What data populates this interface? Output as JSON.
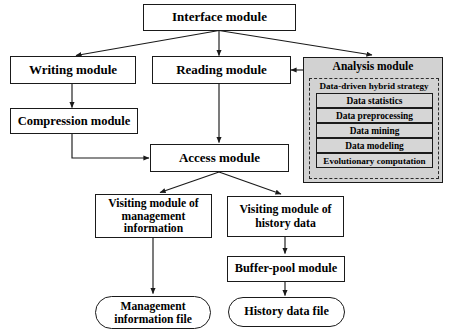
{
  "diagram": {
    "colors": {
      "box_border": "#1a1a1a",
      "box_fill": "#ffffff",
      "group_fill": "#d2d2d2",
      "sub_item_fill": "#d6d6d6",
      "edge": "#1a1a1a"
    },
    "nodes": {
      "interface_module": "Interface module",
      "writing_module": "Writing module",
      "reading_module": "Reading module",
      "analysis_module": "Analysis module",
      "compression_module": "Compression module",
      "access_module": "Access module",
      "visiting_management": "Visiting module of management information",
      "visiting_history": "Visiting module of history data",
      "buffer_pool_module": "Buffer-pool module",
      "management_file": "Management information file",
      "history_file": "History data file"
    },
    "analysis_group": {
      "title": "Analysis module",
      "strategy_label": "Data-driven hybrid strategy",
      "items": [
        "Data statistics",
        "Data preprocessing",
        "Data mining",
        "Data modeling",
        "Evolutionary computation"
      ]
    },
    "edges": [
      {
        "from": "interface_module",
        "to": "writing_module"
      },
      {
        "from": "interface_module",
        "to": "reading_module"
      },
      {
        "from": "interface_module",
        "to": "analysis_module"
      },
      {
        "from": "writing_module",
        "to": "compression_module"
      },
      {
        "from": "compression_module",
        "to": "access_module"
      },
      {
        "from": "reading_module",
        "to": "access_module"
      },
      {
        "from": "analysis_module",
        "to": "reading_module"
      },
      {
        "from": "access_module",
        "to": "visiting_management"
      },
      {
        "from": "access_module",
        "to": "visiting_history"
      },
      {
        "from": "visiting_management",
        "to": "management_file"
      },
      {
        "from": "visiting_history",
        "to": "buffer_pool_module"
      },
      {
        "from": "buffer_pool_module",
        "to": "history_file"
      }
    ]
  }
}
